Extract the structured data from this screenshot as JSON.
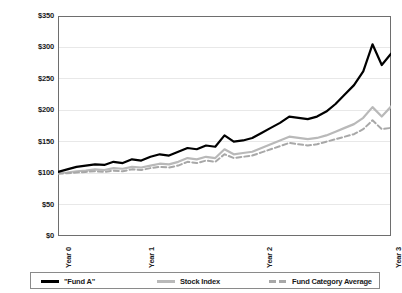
{
  "chart_data": {
    "type": "line",
    "title": "",
    "subtitle": "",
    "xlabel": "",
    "ylabel": "",
    "ylim": [
      0,
      350
    ],
    "ytick_labels": [
      "$0",
      "$50",
      "$100",
      "$150",
      "$200",
      "$250",
      "$300",
      "$350"
    ],
    "ytick_values": [
      0,
      50,
      100,
      150,
      200,
      250,
      300,
      350
    ],
    "xtick_labels": [
      "Year 0",
      "Year 1",
      "Year 2",
      "Year 3"
    ],
    "xtick_values": [
      0,
      12,
      24,
      36
    ],
    "xlim": [
      0,
      36
    ],
    "grid": "horizontal",
    "legend_position": "bottom",
    "x": [
      0,
      1,
      2,
      3,
      4,
      5,
      6,
      7,
      8,
      9,
      10,
      11,
      12,
      13,
      14,
      15,
      16,
      17,
      18,
      19,
      20,
      21,
      22,
      23,
      24,
      25,
      26,
      27,
      28,
      29,
      30,
      31,
      32,
      33,
      34,
      35,
      36
    ],
    "series": [
      {
        "name": "\"Fund A\"",
        "color": "#000000",
        "style": "solid",
        "width": 2.2,
        "values": [
          102,
          106,
          110,
          112,
          114,
          113,
          118,
          116,
          122,
          120,
          126,
          130,
          128,
          134,
          140,
          138,
          144,
          142,
          160,
          150,
          152,
          156,
          164,
          172,
          180,
          190,
          188,
          186,
          190,
          198,
          210,
          225,
          240,
          262,
          305,
          272,
          290
        ]
      },
      {
        "name": "Stock Index",
        "color": "#b9b9b9",
        "style": "solid",
        "width": 2.2,
        "values": [
          100,
          101,
          103,
          104,
          106,
          105,
          108,
          107,
          110,
          109,
          112,
          115,
          114,
          118,
          124,
          122,
          126,
          124,
          138,
          130,
          132,
          134,
          140,
          146,
          152,
          158,
          156,
          154,
          156,
          160,
          166,
          172,
          178,
          188,
          205,
          190,
          206
        ]
      },
      {
        "name": "Fund Category Average",
        "color": "#a8a8a8",
        "style": "dashed",
        "width": 2.0,
        "values": [
          99,
          100,
          101,
          102,
          103,
          102,
          104,
          103,
          106,
          105,
          108,
          110,
          109,
          112,
          118,
          116,
          120,
          118,
          130,
          124,
          126,
          128,
          133,
          138,
          143,
          148,
          146,
          144,
          146,
          150,
          154,
          158,
          162,
          170,
          184,
          170,
          172
        ]
      }
    ]
  }
}
